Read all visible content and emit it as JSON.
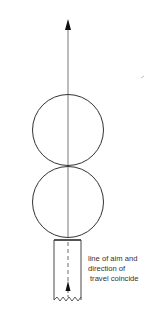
{
  "diagram": {
    "caption_lines": [
      "line of aim and",
      "direction of",
      "travel coincide"
    ],
    "elements": {
      "aim_arrow": "upward arrow along line of aim",
      "circles": [
        "upper ball",
        "lower ball"
      ],
      "cue": "cue stick tip with arrow showing direction of travel"
    },
    "colors": {
      "stroke": "#333333",
      "background": "#ffffff"
    }
  }
}
